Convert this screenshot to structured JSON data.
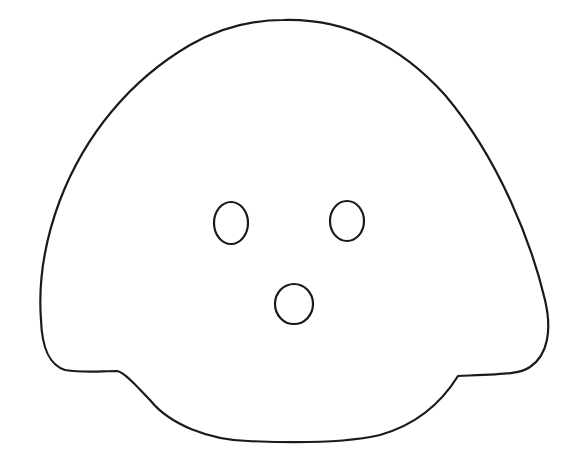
{
  "drawing": {
    "subject": "line-art face outline",
    "background": "#ffffff",
    "stroke_color": "#1a1a1a",
    "stroke_width": 2.2,
    "head": {
      "path": "M 283 20 C 345 18 400 45 445 95 C 500 160 532 245 545 300 C 552 330 548 355 530 367 C 520 374 505 374 458 376 C 440 405 415 425 380 435 C 340 444 290 443 248 441 C 210 440 170 425 150 400 C 140 390 125 372 117 371 C 100 371 85 373 65 370 C 50 365 42 350 41 320 C 38 280 45 240 60 200 C 85 135 130 80 190 45 C 220 28 250 20 283 20 Z"
    },
    "eyes": [
      {
        "name": "left-eye",
        "cx": 231,
        "cy": 223,
        "rx": 17,
        "ry": 21
      },
      {
        "name": "right-eye",
        "cx": 347,
        "cy": 221,
        "rx": 17,
        "ry": 20
      }
    ],
    "mouth": {
      "cx": 294,
      "cy": 304,
      "rx": 19,
      "ry": 20
    }
  }
}
